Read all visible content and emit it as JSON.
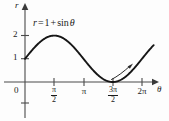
{
  "figure": {
    "kind": "cartesian-plot",
    "background_color": "#fdfdfd",
    "ink_color": "#1a1a1a",
    "curve_color": "#161616"
  },
  "axes": {
    "y_axis_name": "r",
    "x_axis_name": "θ",
    "origin_label": "0",
    "y_ticks": [
      {
        "label": "1",
        "value": 1
      },
      {
        "label": "2",
        "value": 2
      }
    ],
    "x_ticks": [
      {
        "kind": "fraction",
        "numerator": "π",
        "denominator": "2",
        "label": "π/2",
        "value": 1.5708
      },
      {
        "kind": "plain",
        "label": "π",
        "value": 3.1416
      },
      {
        "kind": "fraction",
        "numerator": "3π",
        "denominator": "2",
        "label": "3π/2",
        "value": 4.7124
      },
      {
        "kind": "plain",
        "label": "2π",
        "value": 6.2832
      }
    ]
  },
  "annotations": {
    "equation": {
      "lhs": "r",
      "equals": "=",
      "rhs_constant": "1",
      "plus": "+",
      "function": "sin",
      "variable": "θ",
      "full_text": "r = 1 + sin θ"
    },
    "direction_arrow": {
      "name": "direction-of-travel-arrow",
      "description": "curved arrow along the rising branch after 3π/2"
    }
  },
  "chart_data": {
    "type": "line",
    "title": "",
    "subtitle": "",
    "xlabel": "θ",
    "ylabel": "r",
    "grid": false,
    "legend": null,
    "xlim": [
      0,
      6.9115
    ],
    "ylim": [
      -0.35,
      2.45
    ],
    "xtick_labels": [
      "π/2",
      "π",
      "3π/2",
      "2π"
    ],
    "xtick_values": [
      1.5708,
      3.1416,
      4.7124,
      6.2832
    ],
    "ytick_labels": [
      "1",
      "2"
    ],
    "ytick_values": [
      1,
      2
    ],
    "series": [
      {
        "name": "r = 1 + sin θ",
        "formula": "1 + sin(theta)",
        "x": [
          0,
          0.3927,
          0.7854,
          1.1781,
          1.5708,
          1.9635,
          2.3562,
          2.7489,
          3.1416,
          3.5343,
          3.927,
          4.3197,
          4.7124,
          5.1051,
          5.4978,
          5.8905,
          6.2832,
          6.6759
        ],
        "values": [
          1,
          1.3827,
          1.7071,
          1.9239,
          2,
          1.9239,
          1.7071,
          1.3827,
          1,
          0.6173,
          0.2929,
          0.0761,
          0,
          0.0761,
          0.2929,
          0.6173,
          1,
          1.3827
        ]
      }
    ],
    "annotations": [
      {
        "text": "r = 1 + sin θ",
        "x": 1.6,
        "y": 2.3
      }
    ]
  }
}
